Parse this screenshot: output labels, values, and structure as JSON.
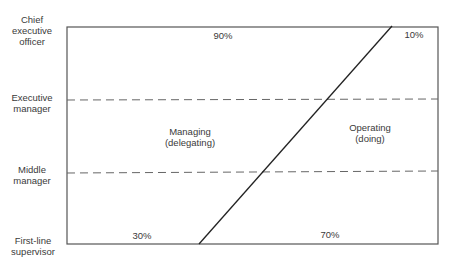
{
  "diagram": {
    "levels": [
      {
        "line1": "Chief",
        "line2": "executive",
        "line3": "officer"
      },
      {
        "line1": "Executive",
        "line2": "manager"
      },
      {
        "line1": "Middle",
        "line2": "manager"
      },
      {
        "line1": "First-line",
        "line2": "supervisor"
      }
    ],
    "regions": {
      "managing": {
        "line1": "Managing",
        "line2": "(delegating)"
      },
      "operating": {
        "line1": "Operating",
        "line2": "(doing)"
      }
    },
    "percentages": {
      "top_managing": "90%",
      "top_operating": "10%",
      "bottom_managing": "30%",
      "bottom_operating": "70%"
    },
    "colors": {
      "frame": "#555555",
      "diagonal": "#222222",
      "dashed": "#666666",
      "text": "#3a3a3a"
    }
  }
}
